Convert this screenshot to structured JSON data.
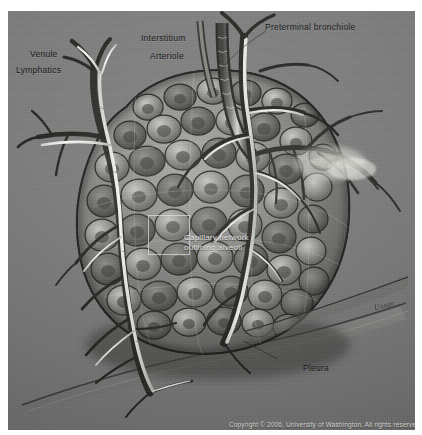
{
  "figure": {
    "background_color": "#ffffff",
    "plate_color": "#7c7c7c",
    "ink_color": "#16181a",
    "highlight_color": "#f2f2ee"
  },
  "labels": {
    "venule": "Venule",
    "lymphatics": "Lymphatics",
    "interstitium": "Interstitium",
    "arteriole": "Arteriole",
    "preterminal_bronchiole": "Preterminal bronchiole",
    "capillary_line_1": "Capillary network",
    "capillary_line_2": "outlining alveoli",
    "pleura": "Pleura"
  },
  "signature": "Ussar",
  "copyright": "Copyright © 2006, University of Washington. All rights reserved."
}
